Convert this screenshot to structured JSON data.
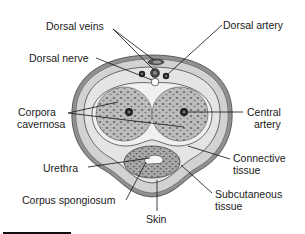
{
  "diagram": {
    "labels": {
      "dorsal_veins": "Dorsal veins",
      "dorsal_artery": "Dorsal artery",
      "dorsal_nerve": "Dorsal nerve",
      "corpora_cavernosa_line1": "Corpora",
      "corpora_cavernosa_line2": "cavernosa",
      "central_artery_line1": "Central",
      "central_artery_line2": "artery",
      "connective_tissue_line1": "Connective",
      "connective_tissue_line2": "tissue",
      "urethra": "Urethra",
      "corpus_spongiosum": "Corpus spongiosum",
      "subcutaneous_tissue_line1": "Subcutaneous",
      "subcutaneous_tissue_line2": "tissue",
      "skin": "Skin"
    },
    "colors": {
      "skin_outer": "#8f8f8f",
      "subcutaneous": "#d4d4d4",
      "connective": "#e6e6e6",
      "erectile": "#b8b8b8",
      "erectile_dots": "#6a6a6a",
      "line": "#111111",
      "text": "#1a1a1a"
    }
  }
}
